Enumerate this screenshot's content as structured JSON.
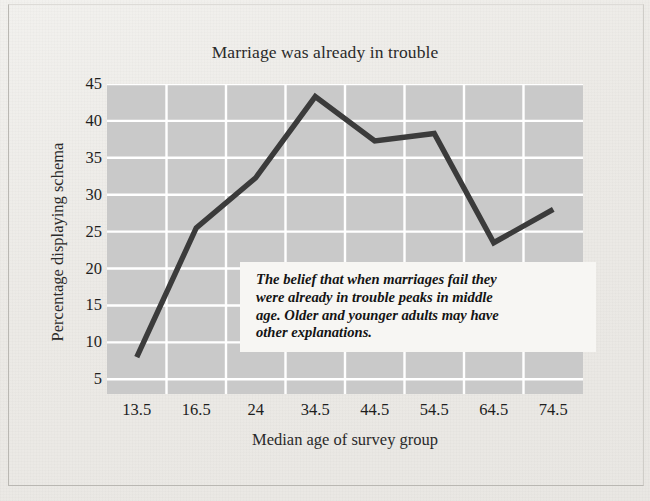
{
  "chart_data": {
    "type": "line",
    "title": "Marriage was already in trouble",
    "xlabel": "Median age of survey group",
    "ylabel": "Percentage displaying schema",
    "categories": [
      "13.5",
      "16.5",
      "24",
      "34.5",
      "44.5",
      "54.5",
      "64.5",
      "74.5"
    ],
    "values": [
      8,
      25.5,
      32.3,
      43.3,
      37.3,
      38.3,
      23.5,
      28
    ],
    "series": [
      {
        "name": "Percentage displaying schema",
        "values": [
          8,
          25.5,
          32.3,
          43.3,
          37.3,
          38.3,
          23.5,
          28
        ]
      }
    ],
    "y_ticks": [
      45,
      40,
      35,
      30,
      25,
      20,
      15,
      10,
      5
    ],
    "ylim": [
      3,
      45
    ],
    "grid": true,
    "legend": "none",
    "annotations": [
      {
        "name": "callout",
        "text": "The belief that when marriages fail they were already in trouble peaks in middle age. Older and younger adults may have other explanations."
      }
    ],
    "colors": {
      "line": "#3b3b3b",
      "plot_background": "#c9c9c9",
      "gridline": "#ffffff",
      "page_background": "#eeece8",
      "annotation_background": "#f7f6f3",
      "text": "#1e1e1e"
    }
  },
  "annotation": {
    "line1": "The belief that when marriages fail they",
    "line2": "were already in trouble peaks in middle",
    "line3": "age. Older and younger adults may have",
    "line4": "other explanations."
  }
}
